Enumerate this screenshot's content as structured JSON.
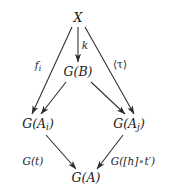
{
  "diagram": {
    "type": "commutative-diagram",
    "background_color": "#ffffff",
    "stroke_color": "#2b2b2b",
    "text_color": "#1c1c1c",
    "nodes": [
      {
        "id": "X",
        "label": "X",
        "base": "X",
        "sub": "",
        "x": 78,
        "y": 18
      },
      {
        "id": "GB",
        "label": "G(B)",
        "base": "G(B)",
        "sub": "",
        "x": 78,
        "y": 72
      },
      {
        "id": "GAi",
        "label": "G(A_i)",
        "base": "G(A",
        "sub": "i",
        "x": 38,
        "y": 125
      },
      {
        "id": "GAj",
        "label": "G(A_j)",
        "base": "G(A",
        "sub": "j",
        "x": 129,
        "y": 125
      },
      {
        "id": "GA",
        "label": "G(A)",
        "base": "G(A)",
        "sub": "",
        "x": 86,
        "y": 178
      }
    ],
    "edges": [
      {
        "id": "x-to-gb",
        "from": "X",
        "to": "GB",
        "label": "k"
      },
      {
        "id": "x-to-gai",
        "from": "X",
        "to": "GAi",
        "label": "f_i"
      },
      {
        "id": "x-to-gaj",
        "from": "X",
        "to": "GAj",
        "label": "(tau)"
      },
      {
        "id": "gb-to-gai",
        "from": "GB",
        "to": "GAi",
        "label": ""
      },
      {
        "id": "gb-to-gaj",
        "from": "GB",
        "to": "GAj",
        "label": ""
      },
      {
        "id": "gai-to-ga",
        "from": "GAi",
        "to": "GA",
        "label": "G(t)"
      },
      {
        "id": "gaj-to-ga",
        "from": "GAj",
        "to": "GA",
        "label": "G([h] o t')"
      }
    ],
    "labels": {
      "node_x": "X",
      "node_gb_prefix": "G(B)",
      "node_gai_prefix": "G(A",
      "node_gai_sub": "i",
      "node_gai_suffix": ")",
      "node_gaj_prefix": "G(A",
      "node_gaj_sub": "j",
      "node_gaj_suffix": ")",
      "node_ga": "G(A)",
      "edge_k": "k",
      "edge_f_prefix": "f",
      "edge_f_sub": "i",
      "edge_tau": "⟨τ⟩",
      "edge_gt": "G(t)",
      "edge_gh_prefix": "G([h]",
      "edge_gh_compose": "∘",
      "edge_gh_suffix": "t′",
      "edge_gh_close": ")"
    }
  }
}
